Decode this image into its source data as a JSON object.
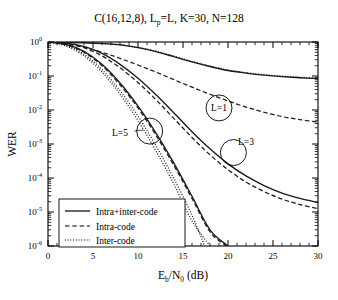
{
  "chart_data": {
    "type": "line",
    "title": "C(16,12,8), Lp=L, K=30, N=128",
    "title_parts": {
      "pre": "C(16,12,8), L",
      "sub": "p",
      "post": "=L, K=30, N=128"
    },
    "xlabel": "Eb/N0 (dB)",
    "xlabel_parts": {
      "first": "E",
      "first_sub": "b",
      "slash": "/N",
      "second_sub": "0",
      "unit": " (dB)"
    },
    "ylabel": "WER",
    "xlim": [
      0,
      30
    ],
    "ylim": [
      1e-06,
      1
    ],
    "yscale": "log",
    "xticks": [
      0,
      5,
      10,
      15,
      20,
      25,
      30
    ],
    "xticklabels": [
      "0",
      "5",
      "10",
      "15",
      "20",
      "25",
      "30"
    ],
    "yticks": [
      1,
      0.1,
      0.01,
      0.001,
      0.0001,
      1e-05,
      1e-06
    ],
    "yticklabels": [
      "10^0",
      "10^-1",
      "10^-2",
      "10^-3",
      "10^-4",
      "10^-5",
      "10^-6"
    ],
    "ytick_exponents": [
      "0",
      "-1",
      "-2",
      "-3",
      "-4",
      "-5",
      "-6"
    ],
    "ytick_mantissa": "10",
    "grid": false,
    "minor_ticks": true,
    "legend_position": "lower left",
    "legend": [
      {
        "label": "Intra+inter-code",
        "style": "solid"
      },
      {
        "label": "Intra-code",
        "style": "dashed"
      },
      {
        "label": "Inter-code",
        "style": "dotted"
      }
    ],
    "annotations": [
      {
        "text": "L=1",
        "x": 19.0,
        "y": 0.0115,
        "circle": true
      },
      {
        "text": "L=5",
        "x": 8.0,
        "y": 0.0022,
        "circle": false
      },
      {
        "text": "L=3",
        "x": 22.0,
        "y": 0.00115,
        "circle": false
      },
      {
        "text": "",
        "x": 11.3,
        "y": 0.0024,
        "circle": true
      },
      {
        "text": "",
        "x": 20.6,
        "y": 0.00056,
        "circle": true
      }
    ],
    "series": [
      {
        "name": "L=1 Intra+inter-code",
        "group": "L=1",
        "style": "solid",
        "x": [
          0,
          2,
          4,
          6,
          8,
          10,
          12,
          14,
          16,
          18,
          20,
          22,
          24,
          26,
          28,
          30
        ],
        "y": [
          1.0,
          0.98,
          0.95,
          0.9,
          0.82,
          0.68,
          0.52,
          0.37,
          0.26,
          0.19,
          0.145,
          0.122,
          0.106,
          0.096,
          0.089,
          0.084
        ]
      },
      {
        "name": "L=1 Inter-code",
        "group": "L=1",
        "style": "dotted",
        "x": [
          0,
          2,
          4,
          6,
          8,
          10,
          12,
          14,
          16,
          18,
          20,
          22,
          24,
          26,
          28,
          30
        ],
        "y": [
          1.0,
          0.985,
          0.96,
          0.91,
          0.84,
          0.7,
          0.54,
          0.385,
          0.27,
          0.197,
          0.15,
          0.126,
          0.109,
          0.099,
          0.092,
          0.087
        ]
      },
      {
        "name": "L=1 Intra-code",
        "group": "L=1",
        "style": "dashed",
        "x": [
          0,
          2,
          4,
          6,
          8,
          10,
          12,
          14,
          16,
          18,
          20,
          22,
          24,
          26,
          28,
          30
        ],
        "y": [
          1.0,
          0.88,
          0.7,
          0.5,
          0.33,
          0.21,
          0.13,
          0.078,
          0.047,
          0.029,
          0.0185,
          0.0122,
          0.0086,
          0.0064,
          0.0052,
          0.0044
        ]
      },
      {
        "name": "L=3 Intra+inter-code",
        "group": "L=3",
        "style": "solid",
        "x": [
          0,
          2,
          4,
          6,
          8,
          10,
          12,
          14,
          16,
          18,
          20,
          22,
          24,
          26,
          28,
          30
        ],
        "y": [
          1.0,
          0.93,
          0.74,
          0.46,
          0.22,
          0.086,
          0.028,
          0.0082,
          0.0023,
          0.00072,
          0.00026,
          0.000115,
          6e-05,
          3.6e-05,
          2.5e-05,
          1.9e-05
        ]
      },
      {
        "name": "L=3 Intra-code",
        "group": "L=3",
        "style": "dashed",
        "x": [
          0,
          2,
          4,
          6,
          8,
          10,
          12,
          14,
          16,
          18,
          20,
          22,
          24,
          26,
          28,
          30
        ],
        "y": [
          1.0,
          0.9,
          0.68,
          0.39,
          0.175,
          0.064,
          0.02,
          0.0056,
          0.00155,
          0.00048,
          0.000175,
          7.6e-05,
          4e-05,
          2.4e-05,
          1.65e-05,
          1.25e-05
        ]
      },
      {
        "name": "L=5 Intra+inter-code",
        "group": "L=5",
        "style": "solid",
        "x": [
          0,
          2,
          4,
          6,
          8,
          10,
          12,
          14,
          16,
          18,
          20
        ],
        "y": [
          1.0,
          0.85,
          0.53,
          0.22,
          0.062,
          0.013,
          0.0021,
          0.00027,
          2.9e-05,
          3e-06,
          1e-06
        ]
      },
      {
        "name": "L=5 Intra-code",
        "group": "L=5",
        "style": "dashed",
        "x": [
          0,
          2,
          4,
          6,
          8,
          10,
          12,
          14,
          16,
          18,
          19.8
        ],
        "y": [
          1.0,
          0.83,
          0.5,
          0.2,
          0.055,
          0.0115,
          0.0018,
          0.00023,
          2.5e-05,
          2.6e-06,
          1e-06
        ]
      },
      {
        "name": "L=5 Inter-code",
        "group": "L=5",
        "style": "dotted",
        "x": [
          0,
          2,
          4,
          6,
          8,
          10,
          12,
          14,
          16,
          18
        ],
        "y": [
          1.0,
          0.76,
          0.39,
          0.13,
          0.029,
          0.0049,
          0.00062,
          6.5e-05,
          5.5e-06,
          1e-06
        ]
      },
      {
        "name": "L=3 Inter-code",
        "group": "L=3",
        "style": "dotted",
        "x": [
          0,
          2,
          4,
          6,
          8,
          10,
          12,
          14,
          16,
          17.4
        ],
        "y": [
          1.0,
          0.8,
          0.44,
          0.155,
          0.037,
          0.0066,
          0.00088,
          9.5e-05,
          8e-06,
          1e-06
        ]
      }
    ]
  },
  "colors": {
    "axis": "#000000",
    "curve": "#1a1a1a",
    "background": "#ffffff"
  }
}
